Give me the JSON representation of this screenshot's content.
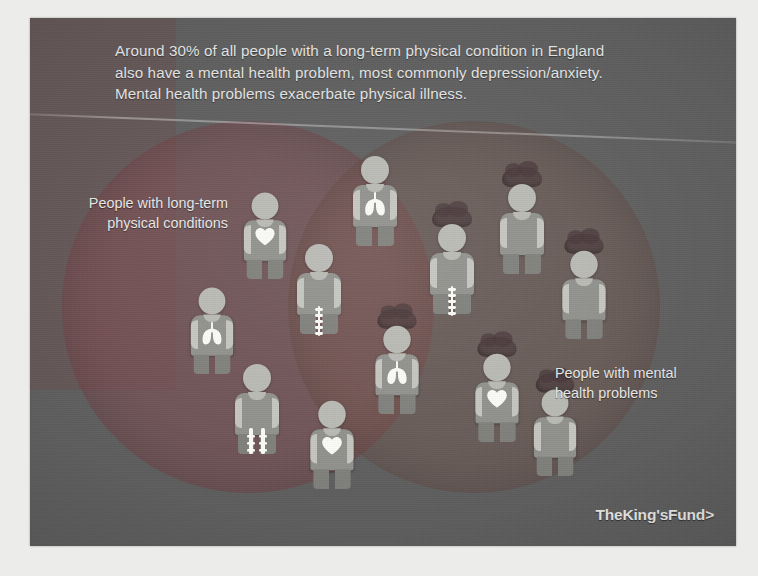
{
  "slide": {
    "title": "Around 30% of all people with a long-term physical condition in England also have a mental health problem, most commonly depression/anxiety. Mental health problems exacerbate physical illness.",
    "headline_lines": [
      "Around 30% of all people with a long-term physical condition in England",
      "also have a mental health problem, most commonly depression/anxiety.",
      "Mental health problems exacerbate physical illness."
    ],
    "logo": "TheKing'sFund>",
    "background_color": "#5d5d5d"
  },
  "venn": {
    "left": {
      "label_lines": [
        "People with long-term",
        "physical conditions"
      ],
      "label": "People with long-term physical conditions",
      "color": "#8a464e"
    },
    "right": {
      "label_lines": [
        "People with mental",
        "health problems"
      ],
      "label": "People with mental health problems",
      "color": "#78564a"
    },
    "overlap_color": "#783c42"
  },
  "figures": [
    {
      "name": "person-lungs-top-center",
      "x": 318,
      "y": 122,
      "organ": "lungs",
      "brain": false,
      "scale": 1.0,
      "group": "physical"
    },
    {
      "name": "person-heart-upper-left",
      "x": 208,
      "y": 155,
      "organ": "heart",
      "brain": false,
      "scale": 0.96,
      "group": "physical"
    },
    {
      "name": "person-lungs-mid-left",
      "x": 155,
      "y": 250,
      "organ": "lungs",
      "brain": false,
      "scale": 0.96,
      "group": "physical"
    },
    {
      "name": "person-spine-mid-center",
      "x": 262,
      "y": 210,
      "organ": "spine",
      "brain": false,
      "scale": 1.0,
      "group": "physical"
    },
    {
      "name": "person-pelvis-lower-left",
      "x": 200,
      "y": 330,
      "organ": "pelvis",
      "brain": false,
      "scale": 1.0,
      "group": "physical"
    },
    {
      "name": "person-heart-bottom-left",
      "x": 275,
      "y": 365,
      "organ": "heart",
      "brain": false,
      "scale": 0.98,
      "group": "physical"
    },
    {
      "name": "person-brain-spine-center",
      "x": 395,
      "y": 190,
      "organ": "spine",
      "brain": true,
      "scale": 1.0,
      "group": "overlap"
    },
    {
      "name": "person-brain-lungs-center",
      "x": 340,
      "y": 290,
      "organ": "lungs",
      "brain": true,
      "scale": 0.98,
      "group": "overlap"
    },
    {
      "name": "person-brain-heart-right",
      "x": 440,
      "y": 318,
      "organ": "heart",
      "brain": true,
      "scale": 0.98,
      "group": "overlap"
    },
    {
      "name": "person-brain-upper-right",
      "x": 465,
      "y": 150,
      "organ": "none",
      "brain": true,
      "scale": 1.0,
      "group": "mental"
    },
    {
      "name": "person-brain-far-right",
      "x": 527,
      "y": 215,
      "organ": "none",
      "brain": true,
      "scale": 0.98,
      "group": "mental"
    },
    {
      "name": "person-brain-lower-right",
      "x": 498,
      "y": 352,
      "organ": "none",
      "brain": true,
      "scale": 0.96,
      "group": "mental"
    }
  ],
  "organ_icons": {
    "heart": "heart-icon",
    "lungs": "lungs-icon",
    "spine": "spine-icon",
    "pelvis": "pelvis-icon",
    "brain": "brain-cloud-icon"
  }
}
